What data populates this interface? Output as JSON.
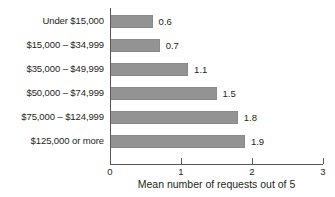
{
  "chart_data": {
    "type": "bar",
    "orientation": "horizontal",
    "title": "",
    "xlabel": "Mean number of requests out of 5",
    "ylabel": "",
    "xlim": [
      0,
      3
    ],
    "xticks": [
      0,
      1,
      2,
      3
    ],
    "xtick_labels": [
      "0",
      "1",
      "2",
      "3"
    ],
    "grid": false,
    "legend": false,
    "bar_color": "#939393",
    "text_color": "#231f20",
    "axis_color": "#58595b",
    "categories": [
      "Under $15,000",
      "$15,000 – $34,999",
      "$35,000 – $49,999",
      "$50,000 – $74,999",
      "$75,000 – $124,999",
      "$125,000 or more"
    ],
    "values": [
      0.6,
      0.7,
      1.1,
      1.5,
      1.8,
      1.9
    ],
    "value_labels": [
      "0.6",
      "0.7",
      "1.1",
      "1.5",
      "1.8",
      "1.9"
    ]
  }
}
